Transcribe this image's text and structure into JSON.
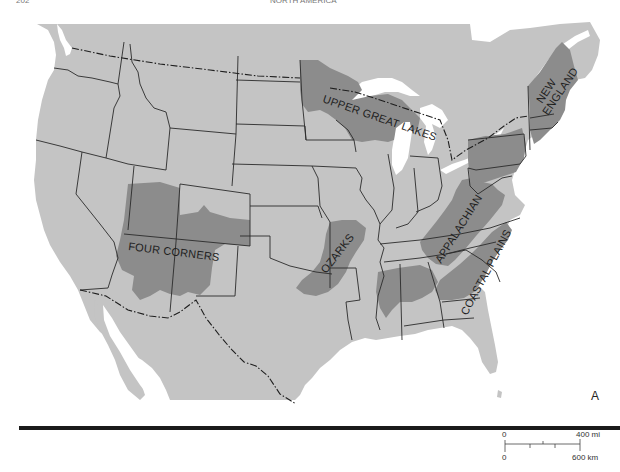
{
  "header": {
    "page_number": "202",
    "running_title": "NORTH AMERICA"
  },
  "map": {
    "panel_letter": "A",
    "colors": {
      "water": "#ffffff",
      "land": "#c4c4c4",
      "region": "#8c8c8c",
      "border": "#2a2a2a",
      "rule": "#1a1a1a"
    },
    "regions": [
      {
        "id": "upper-great-lakes",
        "label": "UPPER GREAT LAKES"
      },
      {
        "id": "new-england",
        "label": "NEW ENGLAND",
        "label_lines": [
          "NEW",
          "ENGLAND"
        ]
      },
      {
        "id": "four-corners",
        "label": "FOUR CORNERS"
      },
      {
        "id": "ozarks",
        "label": "OZARKS"
      },
      {
        "id": "appalachian",
        "label": "APPALACHIAN"
      },
      {
        "id": "coastal-plains",
        "label": "COASTAL PLAINS"
      }
    ]
  },
  "scale_bar": {
    "top_start": "0",
    "top_end": "400 mi",
    "bottom_start": "0",
    "bottom_end": "600 km"
  }
}
